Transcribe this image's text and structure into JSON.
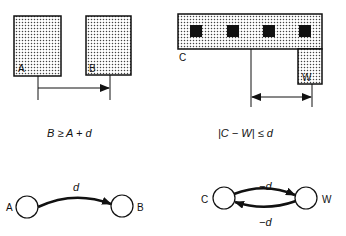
{
  "left_panel": {
    "box_a_label": "A",
    "box_b_label": "B",
    "constraint": "B ≥ A + d",
    "graph": {
      "node_a": "A",
      "node_b": "B",
      "edge_label": "d"
    }
  },
  "right_panel": {
    "box_c_label": "C",
    "box_w_label": "W",
    "constraint": "|C − W| ≤ d",
    "graph": {
      "node_c": "C",
      "node_w": "W",
      "edge_top_label": "−d",
      "edge_bottom_label": "−d"
    }
  },
  "colors": {
    "stroke": "#111111",
    "fill_dots": "#555555",
    "background": "#ffffff"
  }
}
